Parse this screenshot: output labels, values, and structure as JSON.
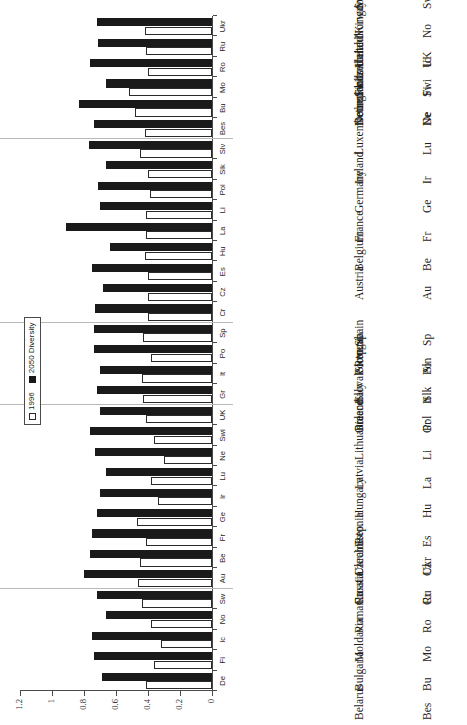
{
  "chart_data": {
    "type": "bar",
    "title": "",
    "xlabel": "",
    "ylabel": "",
    "orientation": "horizontal-printed-sideways",
    "ylim": [
      0,
      1.2
    ],
    "value_ticks": [
      "0",
      "0.2",
      "0.4",
      "0.6",
      "0.8",
      "1",
      "1.2"
    ],
    "value_tick_numbers": [
      0,
      0.2,
      0.4,
      0.6,
      0.8,
      1.0,
      1.2
    ],
    "grid": false,
    "legend_position": "top-right-inside",
    "series": [
      {
        "name": "1996",
        "style": "hollow",
        "color": "#ffffff",
        "values": [
          0.41,
          0.36,
          0.32,
          0.38,
          0.44,
          0.46,
          0.45,
          0.41,
          0.47,
          0.34,
          0.38,
          0.3,
          0.36,
          0.41,
          0.43,
          0.44,
          0.38,
          0.43,
          0.4,
          0.4,
          0.4,
          0.42,
          0.41,
          0.41,
          0.39,
          0.4,
          0.45,
          0.42,
          0.48,
          0.52,
          0.4,
          0.41,
          0.42
        ]
      },
      {
        "name": "2050 Diversity",
        "style": "solid",
        "color": "#181818",
        "values": [
          0.69,
          0.74,
          0.75,
          0.66,
          0.72,
          0.8,
          0.76,
          0.75,
          0.72,
          0.7,
          0.66,
          0.73,
          0.76,
          0.7,
          0.72,
          0.7,
          0.74,
          0.74,
          0.73,
          0.68,
          0.75,
          0.64,
          0.91,
          0.7,
          0.71,
          0.66,
          0.77,
          0.74,
          0.83,
          0.66,
          0.76,
          0.71,
          0.72
        ]
      }
    ],
    "categories": [
      "De",
      "Fi",
      "Ic",
      "No",
      "Sw",
      "Au",
      "Be",
      "Fr",
      "Ge",
      "Ir",
      "Lu",
      "Ne",
      "Swi",
      "UK",
      "Gr",
      "It",
      "Po",
      "Sp",
      "Cr",
      "Cz",
      "Es",
      "Hu",
      "La",
      "Li",
      "Pol",
      "Slk",
      "Slv",
      "Bes",
      "Bu",
      "Mo",
      "Ro",
      "Ru",
      "Ukr"
    ],
    "group_breaks_after": [
      5,
      14,
      18,
      27
    ]
  },
  "legend": {
    "entries": [
      {
        "label": "1996",
        "swatch": "hollow-square"
      },
      {
        "label": "2050 Diversity",
        "swatch": "solid-square"
      }
    ]
  },
  "axis": {
    "value_labels": [
      "1.2",
      "1",
      "0.8",
      "0.6",
      "0.4",
      "0.2",
      "0"
    ],
    "category_labels": [
      "De",
      "Fi",
      "Ic",
      "No",
      "Sw",
      "Au",
      "Be",
      "Fr",
      "Ge",
      "Ir",
      "Lu",
      "Ne",
      "Swi",
      "UK",
      "Gr",
      "It",
      "Po",
      "Sp",
      "Cr",
      "Cz",
      "Es",
      "Hu",
      "La",
      "Li",
      "Pol",
      "Slk",
      "Slv",
      "Bes",
      "Bu",
      "Mo",
      "Ro",
      "Ru",
      "Ukr"
    ]
  },
  "key": {
    "groups": [
      {
        "id": "nordic",
        "rows": [
          {
            "abbr": "De",
            "name": "Denmark"
          },
          {
            "abbr": "Fi",
            "name": "Finland"
          },
          {
            "abbr": "Ic",
            "name": "Iceland"
          },
          {
            "abbr": "No",
            "name": "Norway"
          },
          {
            "abbr": "Sw",
            "name": "Sweden"
          }
        ]
      },
      {
        "id": "western",
        "rows": [
          {
            "abbr": "Au",
            "name": "Austria"
          },
          {
            "abbr": "Be",
            "name": "Belgium"
          },
          {
            "abbr": "Fr",
            "name": "France"
          },
          {
            "abbr": "Ge",
            "name": "Germany"
          },
          {
            "abbr": "Ir",
            "name": "Ireland"
          },
          {
            "abbr": "Lu",
            "name": "Luxembourg"
          },
          {
            "abbr": "Ne",
            "name": "Netherlands"
          },
          {
            "abbr": "Swi",
            "name": "Switzerland"
          },
          {
            "abbr": "UK",
            "name": "United Kingdom"
          }
        ]
      },
      {
        "id": "southern",
        "rows": [
          {
            "abbr": "Gr",
            "name": "Greece"
          },
          {
            "abbr": "It",
            "name": "Italy"
          },
          {
            "abbr": "Po",
            "name": "Portugal"
          },
          {
            "abbr": "Sp",
            "name": "Spain"
          }
        ]
      },
      {
        "id": "central-eastern",
        "rows": [
          {
            "abbr": "Cr",
            "name": "Croatia"
          },
          {
            "abbr": "Cz",
            "name": "Czech Rep."
          },
          {
            "abbr": "Es",
            "name": "Estonia"
          },
          {
            "abbr": "Hu",
            "name": "Hungary"
          },
          {
            "abbr": "La",
            "name": "Latvia"
          },
          {
            "abbr": "Li",
            "name": "Lithuania"
          },
          {
            "abbr": "Pol",
            "name": "Poland"
          },
          {
            "abbr": "Slk",
            "name": "Slovak Rep."
          },
          {
            "abbr": "Sln",
            "name": "Slovenia"
          }
        ]
      },
      {
        "id": "eastern",
        "rows": [
          {
            "abbr": "Bes",
            "name": "Belarus"
          },
          {
            "abbr": "Bu",
            "name": "Bulgaria"
          },
          {
            "abbr": "Mo",
            "name": "Moldavia"
          },
          {
            "abbr": "Ro",
            "name": "Romania"
          },
          {
            "abbr": "Ru",
            "name": "Russia"
          },
          {
            "abbr": "Ukr",
            "name": "Ukraine"
          }
        ]
      }
    ]
  },
  "colors": {
    "series_1996": "#ffffff",
    "series_2050": "#181818",
    "axis": "#4a4a4a",
    "text": "#1e1e1e",
    "background": "#ffffff"
  }
}
